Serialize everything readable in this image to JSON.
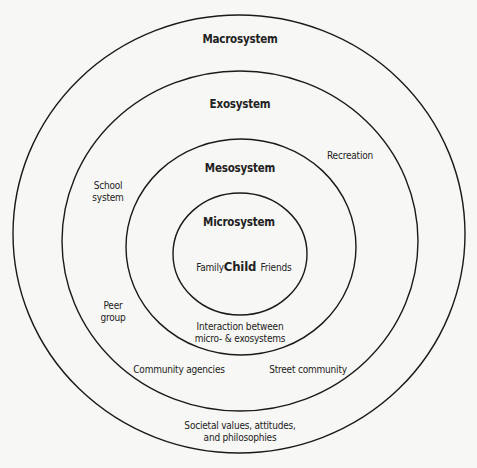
{
  "diagram": {
    "type": "concentric-ellipses",
    "stroke_color": "#1a1a1a",
    "background": "#f7f7f5",
    "rings": [
      {
        "name": "Macrosystem",
        "cx": 239,
        "cy": 234,
        "rx": 226,
        "ry": 219
      },
      {
        "name": "Exosystem",
        "cx": 240,
        "cy": 241,
        "rx": 178,
        "ry": 170
      },
      {
        "name": "Mesosystem",
        "cx": 241,
        "cy": 247,
        "rx": 115,
        "ry": 108
      },
      {
        "name": "Microsystem",
        "cx": 240,
        "cy": 254,
        "rx": 67,
        "ry": 61
      }
    ]
  },
  "labels": {
    "macrosystem": "Macrosystem",
    "exosystem": "Exosystem",
    "mesosystem": "Mesosystem",
    "microsystem": "Microsystem",
    "child": "Child",
    "family": "Family",
    "friends": "Friends",
    "recreation": "Recreation",
    "school_system_1": "School",
    "school_system_2": "system",
    "peer_group_1": "Peer",
    "peer_group_2": "group",
    "interaction_1": "Interaction between",
    "interaction_2": "micro- & exosystems",
    "community_agencies": "Community agencies",
    "street_community": "Street community",
    "societal_1": "Societal values, attitudes,",
    "societal_2": "and philosophies"
  }
}
